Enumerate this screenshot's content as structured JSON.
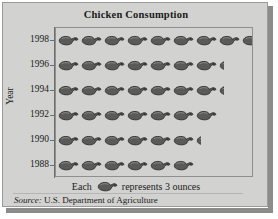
{
  "chart": {
    "title": "Chicken Consumption",
    "axis_title": "Year",
    "legend_prefix": "Each",
    "legend_suffix": "represents 3 ounces",
    "legend_icon": "chicken-icon",
    "source_label": "Source:",
    "source_text": "U.S. Department of Agriculture",
    "colors": {
      "background": "#d2d2d0",
      "icon": "#5a5a58",
      "icon_outline": "#2a2a28",
      "frame": "#9a9a98",
      "shadow": "#8c8c8a",
      "text": "#1a1a1a"
    }
  },
  "chart_data": {
    "type": "bar",
    "subtype": "pictograph",
    "title": "Chicken Consumption",
    "xlabel": "",
    "ylabel": "Year",
    "unit_label": "Each chicken represents 3 ounces",
    "unit_value": 3,
    "unit_name": "ounces",
    "orientation": "horizontal",
    "grid": false,
    "legend_position": "bottom",
    "categories": [
      "1998",
      "1996",
      "1994",
      "1992",
      "1990",
      "1988"
    ],
    "icon_counts": [
      8.5,
      7.25,
      7.25,
      7,
      6.25,
      6
    ],
    "values": [
      25.5,
      21.75,
      21.75,
      21,
      18.75,
      18
    ],
    "rows": [
      {
        "year": "1998",
        "icons_full": 8,
        "icons_partial": 0.5,
        "ounces": 25.5
      },
      {
        "year": "1996",
        "icons_full": 7,
        "icons_partial": 0.25,
        "ounces": 21.75
      },
      {
        "year": "1994",
        "icons_full": 7,
        "icons_partial": 0.25,
        "ounces": 21.75
      },
      {
        "year": "1992",
        "icons_full": 7,
        "icons_partial": 0,
        "ounces": 21
      },
      {
        "year": "1990",
        "icons_full": 6,
        "icons_partial": 0.25,
        "ounces": 18.75
      },
      {
        "year": "1988",
        "icons_full": 6,
        "icons_partial": 0,
        "ounces": 18
      }
    ]
  }
}
